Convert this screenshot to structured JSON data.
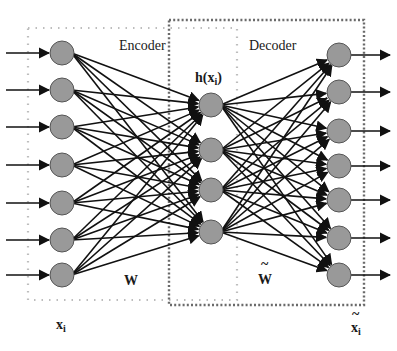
{
  "diagram": {
    "type": "autoencoder",
    "labels": {
      "encoder": "Encoder",
      "decoder": "Decoder",
      "hidden": "h(x",
      "hidden_sub": "i",
      "hidden_close": ")",
      "encoder_weights": "W",
      "decoder_weights": "W",
      "decoder_weights_tilde": "~",
      "input": "x",
      "input_sub": "i",
      "output": "x",
      "output_sub": "i",
      "output_tilde": "~"
    },
    "layers": {
      "input": {
        "count": 7,
        "x": 62,
        "y": [
          53,
          90,
          127,
          165,
          203,
          240,
          275
        ]
      },
      "hidden": {
        "count": 4,
        "x": 211,
        "y": [
          105,
          150,
          190,
          232
        ]
      },
      "output": {
        "count": 7,
        "x": 339,
        "y": [
          55,
          92,
          131,
          166,
          200,
          238,
          275
        ]
      }
    },
    "node_radius": 12,
    "colors": {
      "node_fill": "#999999",
      "node_stroke": "#555555",
      "edge": "#111111",
      "encoder_box": "#bbbbbb",
      "decoder_box": "#666666"
    }
  }
}
